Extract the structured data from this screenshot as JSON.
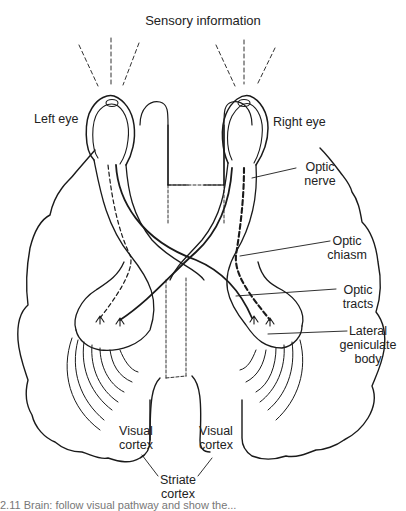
{
  "figure": {
    "title": "Sensory information",
    "labels": {
      "left_eye": "Left eye",
      "right_eye": "Right eye",
      "optic_nerve": [
        "Optic",
        "nerve"
      ],
      "optic_chiasm": [
        "Optic",
        "chiasm"
      ],
      "optic_tracts": [
        "Optic",
        "tracts"
      ],
      "lateral_geniculate_body": [
        "Lateral",
        "geniculate",
        "body"
      ],
      "visual_cortex_left": [
        "Visual",
        "cortex"
      ],
      "visual_cortex_right": [
        "Visual",
        "cortex"
      ],
      "striate_cortex": [
        "Striate",
        "cortex"
      ]
    },
    "caption_fragment": "2.11  Brain: follow visual pathway and show the...",
    "colors": {
      "ink": "#1a1a1a",
      "background": "#ffffff"
    }
  }
}
